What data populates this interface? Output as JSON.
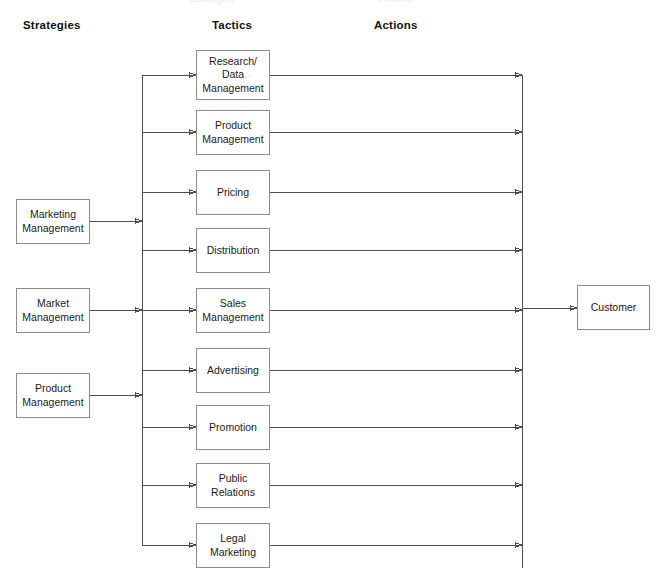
{
  "diagram": {
    "colors": {
      "box_border": "#8c8c8c",
      "line": "#4d4d4d",
      "text": "#1a1a1a",
      "background": "#ffffff"
    },
    "headers": [
      {
        "label": "Strategies",
        "x": 23,
        "y": 20
      },
      {
        "label": "Tactics",
        "x": 212,
        "y": 20
      },
      {
        "label": "Actions",
        "x": 374,
        "y": 20
      }
    ],
    "strategies": [
      {
        "label": "Marketing\nManagement",
        "line1": "Marketing",
        "line2": "Management",
        "x": 16,
        "y": 199,
        "w": 74,
        "h": 45
      },
      {
        "label": "Market\nManagement",
        "line1": "Market",
        "line2": "Management",
        "x": 16,
        "y": 288,
        "w": 74,
        "h": 45
      },
      {
        "label": "Product\nManagement",
        "line1": "Product",
        "line2": "Management",
        "x": 16,
        "y": 373,
        "w": 74,
        "h": 45
      }
    ],
    "tactics": [
      {
        "label": "Research/ Data Management",
        "line1": "Research/",
        "line2": "Data",
        "line3": "Management",
        "x": 196,
        "y": 50,
        "w": 74,
        "h": 50
      },
      {
        "label": "Product Management",
        "line1": "Product",
        "line2": "Management",
        "x": 196,
        "y": 110,
        "w": 74,
        "h": 45
      },
      {
        "label": "Pricing",
        "line1": "Pricing",
        "line2": "",
        "x": 196,
        "y": 170,
        "w": 74,
        "h": 45
      },
      {
        "label": "Distribution",
        "line1": "Distribution",
        "line2": "",
        "x": 196,
        "y": 228,
        "w": 74,
        "h": 45
      },
      {
        "label": "Sales Management",
        "line1": "Sales",
        "line2": "Management",
        "x": 196,
        "y": 288,
        "w": 74,
        "h": 45
      },
      {
        "label": "Advertising",
        "line1": "Advertising",
        "line2": "",
        "x": 196,
        "y": 348,
        "w": 74,
        "h": 45
      },
      {
        "label": "Promotion",
        "line1": "Promotion",
        "line2": "",
        "x": 196,
        "y": 405,
        "w": 74,
        "h": 45
      },
      {
        "label": "Public Relations",
        "line1": "Public",
        "line2": "Relations",
        "x": 196,
        "y": 463,
        "w": 74,
        "h": 45
      },
      {
        "label": "Legal Marketing",
        "line1": "Legal",
        "line2": "Marketing",
        "x": 196,
        "y": 523,
        "w": 74,
        "h": 45
      }
    ],
    "outcome": {
      "label": "Customer",
      "x": 577,
      "y": 285,
      "w": 73,
      "h": 45
    },
    "buses": {
      "left_bus_x": 142,
      "left_bus_top": 75,
      "left_bus_bottom": 545,
      "right_bus_x": 522,
      "right_bus_top": 75,
      "right_bus_bottom": 568
    }
  }
}
